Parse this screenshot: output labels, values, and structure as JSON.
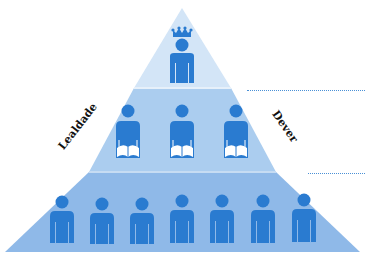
{
  "diagram": {
    "type": "pyramid",
    "colors": {
      "top_layer": "#d3e5f7",
      "middle_layer": "#abcdef",
      "bottom_layer": "#8fb9e8",
      "icon": "#2a7bd0",
      "dotted_line": "#4a90d6"
    },
    "labels": {
      "left": "Lealdade",
      "right": "Dever"
    },
    "tiers": [
      {
        "name": "top",
        "icon": "crowned-person-icon",
        "count": 1
      },
      {
        "name": "middle",
        "icon": "person-reading-book-icon",
        "count": 3
      },
      {
        "name": "bottom",
        "icon": "person-icon",
        "count": 7
      }
    ]
  }
}
